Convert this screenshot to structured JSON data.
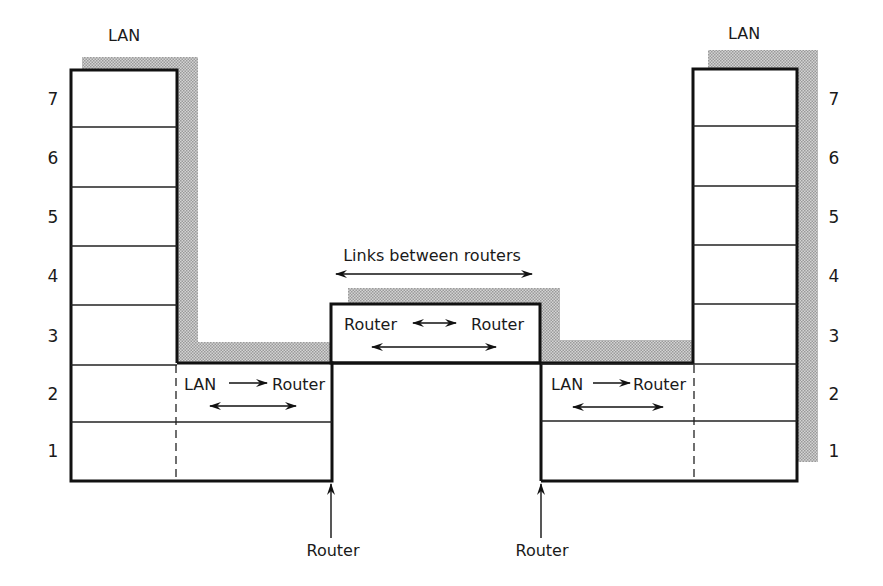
{
  "diagram": {
    "layer_numbers": [
      "7",
      "6",
      "5",
      "4",
      "3",
      "2",
      "1"
    ],
    "left_stack": {
      "label": "LAN"
    },
    "right_stack": {
      "label": "LAN"
    },
    "links_label": "Links between routers",
    "center_box": {
      "left_label": "Router",
      "right_label": "Router"
    },
    "left_segment": {
      "from": "LAN",
      "to": "Router"
    },
    "right_segment": {
      "from": "LAN",
      "to": "Router"
    },
    "bottom_labels": {
      "left_router": "Router",
      "right_router": "Router"
    },
    "colors": {
      "line": "#111111",
      "shading": "#b5b5b5",
      "background": "#ffffff"
    }
  }
}
